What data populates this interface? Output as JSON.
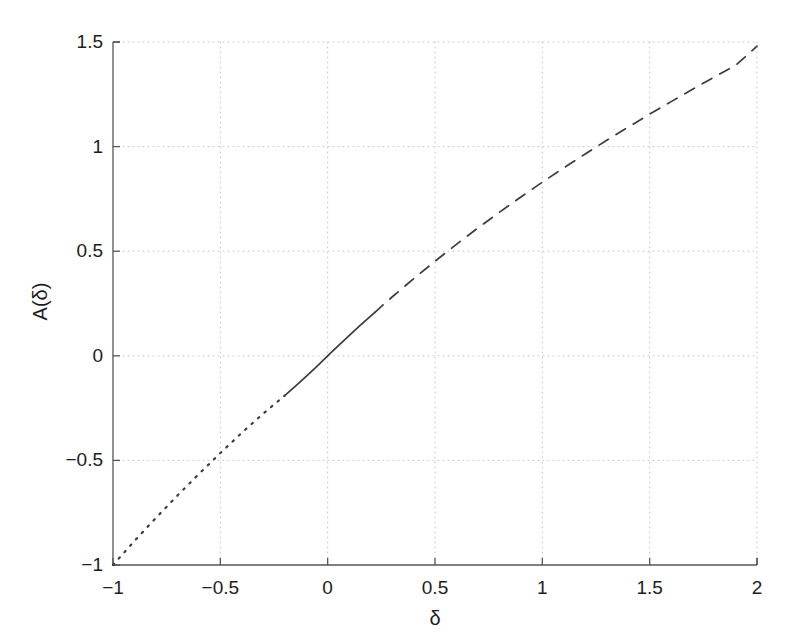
{
  "chart_data": {
    "type": "line",
    "title": "",
    "subtitle": "",
    "xlabel": "δ",
    "ylabel": "A(δ)",
    "xlim": [
      -1,
      2
    ],
    "ylim": [
      -1,
      1.5
    ],
    "xticks": [
      "-1",
      "-0.5",
      "0",
      "0.5",
      "1",
      "1.5",
      "2"
    ],
    "xtick_values": [
      -1,
      -0.5,
      0,
      0.5,
      1,
      1.5,
      2
    ],
    "yticks": [
      "-1",
      "-0.5",
      "0",
      "0.5",
      "1",
      "1.5"
    ],
    "ytick_values": [
      -1,
      -0.5,
      0,
      0.5,
      1,
      1.5
    ],
    "grid": true,
    "grid_style": "dotted",
    "grid_color": "#c8c8c8",
    "legend": null,
    "legend_position": "none",
    "line_color": "#3c3c3c",
    "axis_color": "#555555",
    "background": "#ffffff",
    "annotations": [],
    "series": [
      {
        "name": "A(delta) dotted branch",
        "style": "dotted",
        "x": [
          -1.0,
          -0.9,
          -0.8,
          -0.7,
          -0.6,
          -0.5,
          -0.4,
          -0.3,
          -0.2
        ],
        "y": [
          -1.0,
          -0.885,
          -0.775,
          -0.668,
          -0.565,
          -0.465,
          -0.368,
          -0.276,
          -0.19
        ]
      },
      {
        "name": "A(delta) solid branch",
        "style": "solid",
        "x": [
          -0.2,
          -0.15,
          -0.1,
          -0.05,
          0.0,
          0.05,
          0.1,
          0.15,
          0.2,
          0.22
        ],
        "y": [
          -0.19,
          -0.145,
          -0.098,
          -0.05,
          0.0,
          0.049,
          0.097,
          0.144,
          0.19,
          0.208
        ]
      },
      {
        "name": "A(delta) dashed branch",
        "style": "dashed",
        "x": [
          0.22,
          0.3,
          0.4,
          0.5,
          0.6,
          0.7,
          0.8,
          0.9,
          1.0,
          1.1,
          1.2,
          1.3,
          1.4,
          1.5,
          1.6,
          1.7,
          1.8,
          1.9,
          2.0
        ],
        "y": [
          0.208,
          0.281,
          0.368,
          0.452,
          0.533,
          0.611,
          0.686,
          0.759,
          0.83,
          0.898,
          0.965,
          1.03,
          1.093,
          1.155,
          1.215,
          1.274,
          1.332,
          1.388,
          1.48
        ]
      }
    ]
  }
}
